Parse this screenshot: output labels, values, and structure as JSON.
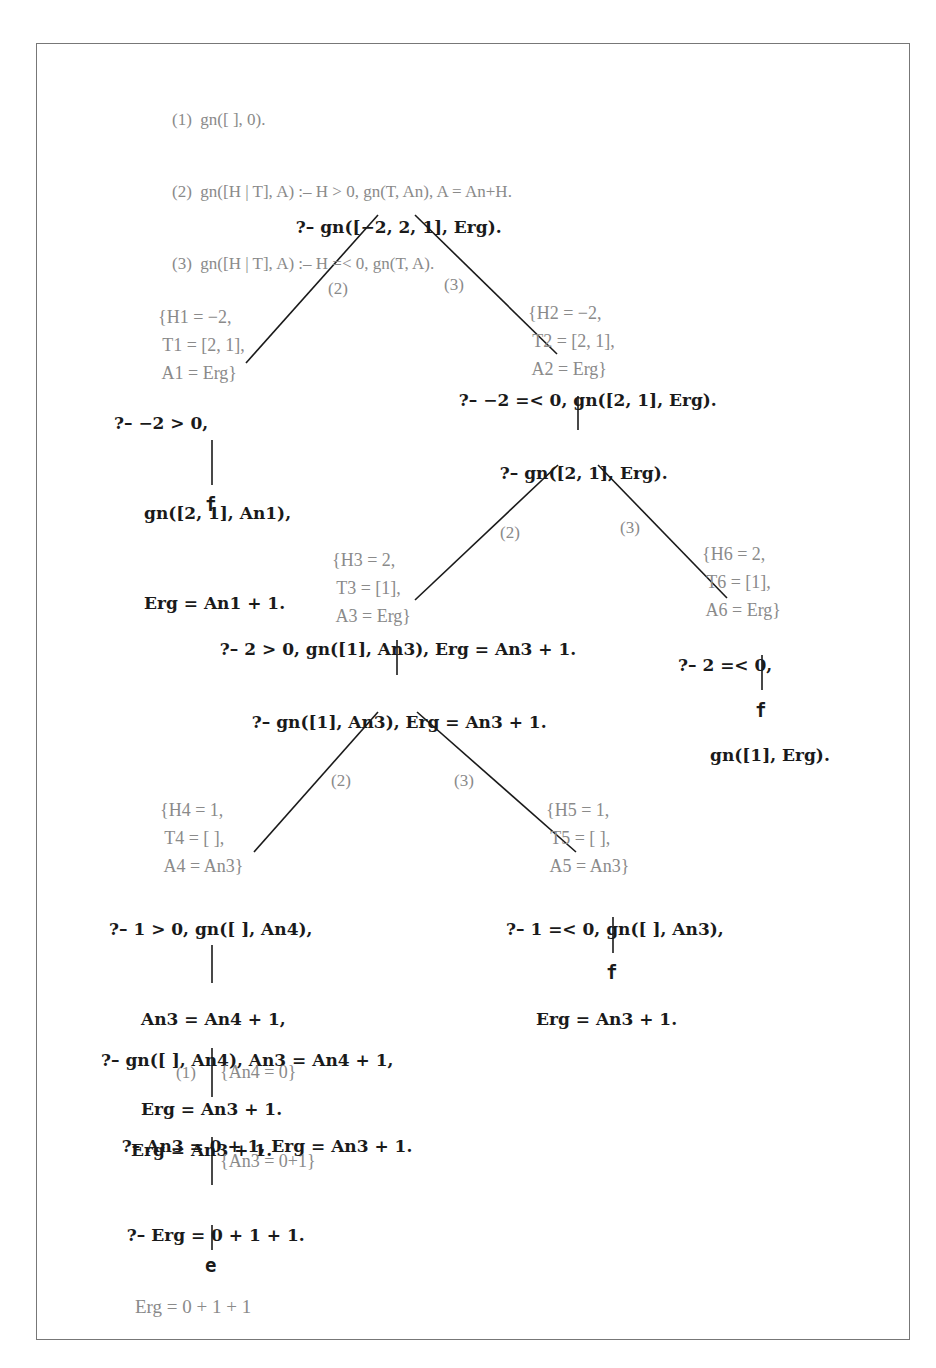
{
  "program": {
    "clauses": [
      {
        "num": "(1)",
        "text": "gn([ ], 0)."
      },
      {
        "num": "(2)",
        "text": "gn([H | T], A) :– H > 0, gn(T, An), A = An+H."
      },
      {
        "num": "(3)",
        "text": "gn([H | T], A) :– H =< 0, gn(T, A)."
      }
    ]
  },
  "tree": {
    "root": {
      "lines": [
        "?– gn([−2, 2, 1], Erg)."
      ]
    },
    "n1_left": {
      "lines": [
        "?– −2 > 0,",
        "gn([2, 1], An1),",
        "Erg = An1 + 1."
      ]
    },
    "n1_left_leaf": "f",
    "n1_right": {
      "lines": [
        "?– −2 =< 0, gn([2, 1], Erg)."
      ]
    },
    "n2": {
      "lines": [
        "?– gn([2, 1], Erg)."
      ]
    },
    "n3_left": {
      "lines": [
        "?– 2 > 0, gn([1], An3), Erg = An3 + 1."
      ]
    },
    "n3_right": {
      "lines": [
        "?– 2 =< 0,",
        "gn([1], Erg)."
      ]
    },
    "n3_right_leaf": "f",
    "n4": {
      "lines": [
        "?– gn([1], An3), Erg = An3 + 1."
      ]
    },
    "n5_left": {
      "lines": [
        "?– 1 > 0, gn([ ], An4),",
        "An3 = An4 + 1,",
        "Erg = An3 + 1."
      ]
    },
    "n5_right": {
      "lines": [
        "?– 1 =< 0, gn([ ], An3),",
        "Erg = An3 + 1."
      ]
    },
    "n5_right_leaf": "f",
    "n6": {
      "lines": [
        "?– gn([ ], An4), An3 = An4 + 1,",
        "Erg = An3 + 1."
      ]
    },
    "n7": {
      "lines": [
        "?– An3 = 0 + 1, Erg = An3 + 1."
      ]
    },
    "n8": {
      "lines": [
        "?– Erg = 0 + 1 + 1."
      ]
    },
    "n8_leaf": "e"
  },
  "substitutions": {
    "s1": [
      "{H1 = −2,",
      " T1 = [2, 1],",
      " A1 = Erg}"
    ],
    "s2": [
      "{H2 = −2,",
      " T2 = [2, 1],",
      " A2 = Erg}"
    ],
    "s3": [
      "{H3 = 2,",
      " T3 = [1],",
      " A3 = Erg}"
    ],
    "s6": [
      "{H6 = 2,",
      " T6 = [1],",
      " A6 = Erg}"
    ],
    "s4": [
      "{H4 = 1,",
      " T4 = [ ],",
      " A4 = An3}"
    ],
    "s5": [
      "{H5 = 1,",
      " T5 = [ ],",
      " A5 = An3}"
    ],
    "s7": "{An4 = 0}",
    "s8": "{An3 = 0+1}"
  },
  "edge_labels": {
    "e1_left": "(2)",
    "e1_right": "(3)",
    "e2_left": "(2)",
    "e2_right": "(3)",
    "e3_left": "(2)",
    "e3_right": "(3)",
    "e_clause1": "(1)"
  },
  "answer": "Erg = 0 + 1 + 1"
}
